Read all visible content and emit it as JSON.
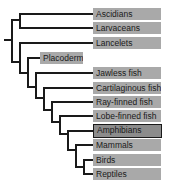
{
  "diagram": {
    "type": "cladogram",
    "line_color": "#1a1a1a",
    "label_bg": "#a9a9a9",
    "highlight_bg": "#8c8c8c",
    "taxa": [
      {
        "label": "Ascidians"
      },
      {
        "label": "Larvaceans"
      },
      {
        "label": "Lancelets"
      },
      {
        "label": "Placoderms",
        "extinct": true
      },
      {
        "label": "Jawless fish"
      },
      {
        "label": "Cartilaginous fish"
      },
      {
        "label": "Ray-finned fish"
      },
      {
        "label": "Lobe-finned fish"
      },
      {
        "label": "Amphibians",
        "highlighted": true
      },
      {
        "label": "Mammals"
      },
      {
        "label": "Birds"
      },
      {
        "label": "Reptiles"
      }
    ]
  }
}
